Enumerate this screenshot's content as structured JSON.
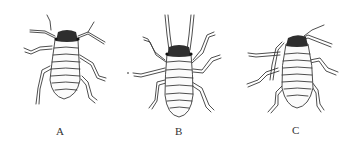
{
  "figure": {
    "panels": [
      {
        "id": "A",
        "label": "A",
        "subject": "insect-nymph-dorsal-view",
        "pose": "antennae spread sideways, legs bent"
      },
      {
        "id": "B",
        "label": "B",
        "subject": "insect-nymph-dorsal-view",
        "pose": "antennae pointing forward, legs spread"
      },
      {
        "id": "C",
        "label": "C",
        "subject": "insect-nymph-dorsal-view",
        "pose": "antennae swept right, legs crossed forward"
      }
    ],
    "colors": {
      "background": "#ffffff",
      "ink": "#3a3a3a",
      "head": "#2e2e2e"
    }
  }
}
